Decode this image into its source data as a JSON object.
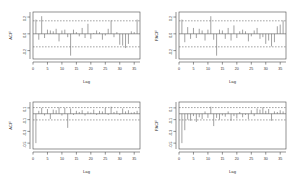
{
  "figure": {
    "background": "#ffffff",
    "foreground": "#4a4a4a",
    "spike_color": "#555555",
    "ci_color": "#5a5a5a",
    "layout": "2x2",
    "panel_count": 4
  },
  "chart_data": [
    {
      "id": "acf-top-left",
      "type": "bar",
      "title": "",
      "xlabel": "Lag",
      "ylabel": "ACF",
      "xlim": [
        0,
        37
      ],
      "ylim": [
        -0.3,
        0.26
      ],
      "xticks": [
        0,
        5,
        10,
        15,
        20,
        25,
        30,
        35
      ],
      "xticklabels": [
        "0",
        "5",
        "10",
        "15",
        "20",
        "25",
        "30",
        "35"
      ],
      "yticks": [
        -0.2,
        0.0,
        0.2
      ],
      "yticklabels": [
        "-0.2",
        "0.0",
        "0.2"
      ],
      "grid": false,
      "legend": "none",
      "conf_level": [
        -0.155,
        0.155
      ],
      "conf_style": "dashed",
      "zero_line": true,
      "x": [
        1,
        2,
        3,
        4,
        5,
        6,
        7,
        8,
        9,
        10,
        11,
        12,
        13,
        14,
        15,
        16,
        17,
        18,
        19,
        20,
        21,
        22,
        23,
        24,
        25,
        26,
        27,
        28,
        29,
        30,
        31,
        32,
        33,
        34,
        35,
        36
      ],
      "values": [
        0.17,
        -0.07,
        0.21,
        -0.05,
        0.05,
        0.04,
        0.03,
        0.06,
        -0.09,
        0.04,
        0.05,
        -0.04,
        -0.26,
        0.05,
        0.02,
        -0.03,
        0.07,
        -0.05,
        0.12,
        -0.06,
        0.01,
        0.04,
        0.02,
        -0.07,
        -0.02,
        0.06,
        0.16,
        -0.04,
        0.02,
        -0.13,
        -0.14,
        -0.17,
        -0.12,
        0.03,
        0.02,
        0.17
      ]
    },
    {
      "id": "pacf-top-right",
      "type": "bar",
      "title": "",
      "xlabel": "Lag",
      "ylabel": "PACF",
      "xlim": [
        0,
        37
      ],
      "ylim": [
        -0.3,
        0.26
      ],
      "xticks": [
        0,
        5,
        10,
        15,
        20,
        25,
        30,
        35
      ],
      "xticklabels": [
        "0",
        "5",
        "10",
        "15",
        "20",
        "25",
        "30",
        "35"
      ],
      "yticks": [
        -0.2,
        0.0,
        0.2
      ],
      "yticklabels": [
        "-0.2",
        "0.0",
        "0.2"
      ],
      "grid": false,
      "legend": "none",
      "conf_level": [
        -0.155,
        0.155
      ],
      "conf_style": "dashed",
      "zero_line": true,
      "x": [
        1,
        2,
        3,
        4,
        5,
        6,
        7,
        8,
        9,
        10,
        11,
        12,
        13,
        14,
        15,
        16,
        17,
        18,
        19,
        20,
        21,
        22,
        23,
        24,
        25,
        26,
        27,
        28,
        29,
        30,
        31,
        32,
        33,
        34,
        35,
        36
      ],
      "values": [
        0.17,
        -0.1,
        0.08,
        -0.06,
        0.07,
        -0.05,
        0.06,
        0.04,
        -0.08,
        0.05,
        0.21,
        -0.07,
        -0.26,
        0.05,
        0.04,
        -0.06,
        0.07,
        -0.08,
        0.1,
        -0.05,
        0.03,
        0.05,
        0.03,
        -0.09,
        -0.03,
        0.04,
        0.07,
        -0.06,
        -0.04,
        -0.12,
        -0.08,
        -0.15,
        -0.1,
        0.09,
        0.11,
        0.16
      ]
    },
    {
      "id": "acf-bottom-left",
      "type": "bar",
      "title": "",
      "xlabel": "Lag",
      "ylabel": "ACF",
      "xlim": [
        0,
        37
      ],
      "ylim": [
        -0.6,
        0.2
      ],
      "xticks": [
        0,
        5,
        10,
        15,
        20,
        25,
        30,
        35
      ],
      "xticklabels": [
        "0",
        "5",
        "10",
        "15",
        "20",
        "25",
        "30",
        "35"
      ],
      "yticks": [
        -0.5,
        -0.3,
        -0.1,
        0.1
      ],
      "yticklabels": [
        "-0.5",
        "-0.3",
        "-0.1",
        "0.1"
      ],
      "grid": false,
      "legend": "none",
      "conf_level": [
        -0.105,
        0.105
      ],
      "conf_style": "dashed",
      "zero_line": true,
      "x": [
        1,
        2,
        3,
        4,
        5,
        6,
        7,
        8,
        9,
        10,
        11,
        12,
        13,
        14,
        15,
        16,
        17,
        18,
        19,
        20,
        21,
        22,
        23,
        24,
        25,
        26,
        27,
        28,
        29,
        30,
        31,
        32,
        33,
        34,
        35,
        36
      ],
      "values": [
        -0.5,
        0.05,
        0.1,
        -0.03,
        0.08,
        -0.09,
        0.07,
        0.06,
        0.11,
        -0.03,
        0.1,
        -0.24,
        0.09,
        -0.02,
        0.05,
        0.03,
        0.06,
        -0.03,
        0.04,
        0.02,
        0.07,
        -0.02,
        0.05,
        0.04,
        0.1,
        -0.02,
        0.12,
        0.03,
        0.05,
        -0.02,
        0.09,
        0.04,
        0.06,
        0.02,
        0.03,
        0.05
      ]
    },
    {
      "id": "pacf-bottom-right",
      "type": "bar",
      "title": "",
      "xlabel": "Lag",
      "ylabel": "PACF",
      "xlim": [
        0,
        37
      ],
      "ylim": [
        -0.6,
        0.2
      ],
      "xticks": [
        0,
        5,
        10,
        15,
        20,
        25,
        30,
        35
      ],
      "xticklabels": [
        "0",
        "5",
        "10",
        "15",
        "20",
        "25",
        "30",
        "35"
      ],
      "yticks": [
        -0.5,
        -0.3,
        -0.1,
        0.1
      ],
      "yticklabels": [
        "-0.5",
        "-0.3",
        "-0.1",
        "0.1"
      ],
      "grid": false,
      "legend": "none",
      "conf_level": [
        -0.105,
        0.105
      ],
      "conf_style": "dashed",
      "zero_line": true,
      "x": [
        1,
        2,
        3,
        4,
        5,
        6,
        7,
        8,
        9,
        10,
        11,
        12,
        13,
        14,
        15,
        16,
        17,
        18,
        19,
        20,
        21,
        22,
        23,
        24,
        25,
        26,
        27,
        28,
        29,
        30,
        31,
        32,
        33,
        34,
        35,
        36
      ],
      "values": [
        -0.5,
        -0.28,
        -0.1,
        -0.12,
        -0.04,
        -0.14,
        -0.06,
        -0.09,
        0.04,
        -0.07,
        0.12,
        -0.21,
        -0.07,
        -0.1,
        -0.03,
        -0.05,
        0.04,
        -0.12,
        -0.04,
        -0.08,
        0.03,
        -0.06,
        -0.02,
        -0.09,
        0.06,
        -0.04,
        0.09,
        0.07,
        0.11,
        0.05,
        0.08,
        -0.12,
        0.04,
        0.03,
        0.06,
        0.04
      ]
    }
  ]
}
